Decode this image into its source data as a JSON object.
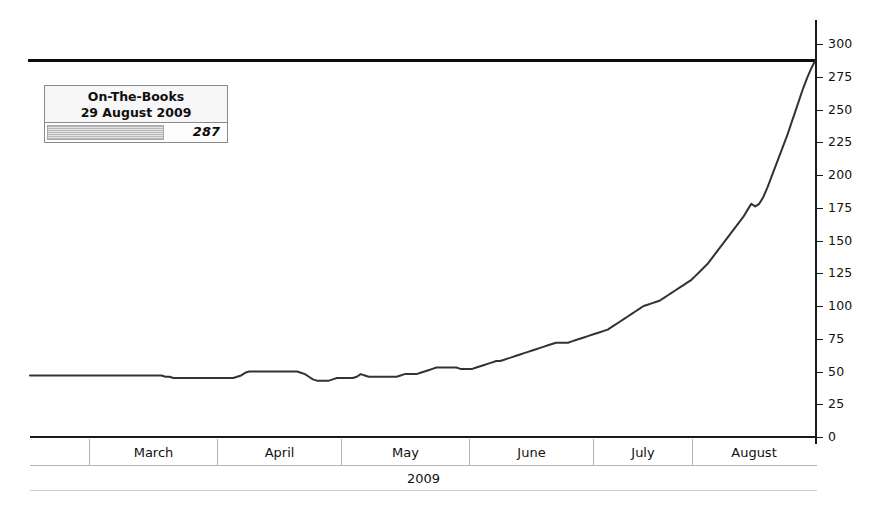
{
  "chart_data": {
    "type": "line",
    "title": "",
    "xlabel": "2009",
    "ylabel": "",
    "ylim": [
      0,
      300
    ],
    "ytick_step": 25,
    "yticks": [
      0,
      25,
      50,
      75,
      100,
      125,
      150,
      175,
      200,
      225,
      250,
      275,
      300
    ],
    "ytick_labels": [
      "0",
      "25",
      "50",
      "75",
      "100",
      "125",
      "150",
      "175",
      "200",
      "225",
      "250",
      "275",
      "300"
    ],
    "grid": false,
    "legend_position": "top-left",
    "categories": [
      "February",
      "March",
      "April",
      "May",
      "June",
      "July",
      "August"
    ],
    "series": [
      {
        "name": "On-The-Books",
        "color": "#333333",
        "x": [
          0,
          1,
          2,
          3,
          4,
          5,
          6,
          7,
          8,
          9,
          10,
          11,
          12,
          13,
          14,
          15,
          16,
          17,
          18,
          19,
          20,
          21,
          22,
          23,
          24,
          25,
          26,
          27,
          28,
          29,
          30,
          31,
          32,
          33,
          34,
          35,
          36,
          37,
          38,
          39,
          40,
          41,
          42,
          43,
          44,
          45,
          46,
          47,
          48,
          49,
          50,
          51,
          52,
          53,
          54,
          55,
          56,
          57,
          58,
          59,
          60,
          61,
          62,
          63,
          64,
          65,
          66,
          67,
          68,
          69,
          70,
          71,
          72,
          73,
          74,
          75,
          76,
          77,
          78,
          79,
          80,
          81,
          82,
          83,
          84,
          85,
          86,
          87,
          88,
          89,
          90,
          91,
          92,
          93,
          94,
          95,
          96,
          97,
          98,
          99,
          100,
          101,
          102,
          103,
          104,
          105,
          106,
          107,
          108,
          109,
          110,
          111,
          112,
          113,
          114,
          115,
          116,
          117,
          118,
          119,
          120,
          121,
          122,
          123,
          124,
          125,
          126,
          127,
          128,
          129,
          130,
          131,
          132,
          133,
          134,
          135,
          136,
          137,
          138,
          139,
          140,
          141,
          142,
          143,
          144,
          145,
          146,
          147,
          148,
          149,
          150,
          151,
          152,
          153,
          154,
          155,
          156,
          157,
          158,
          159,
          160,
          161,
          162,
          163,
          164,
          165,
          166,
          167,
          168,
          169,
          170,
          171,
          172,
          173,
          174,
          175,
          176,
          177,
          178,
          179,
          180,
          181,
          182,
          183,
          184,
          185,
          186,
          187,
          188,
          189,
          190,
          191,
          192,
          193,
          194,
          195,
          196,
          197
        ],
        "values": [
          47,
          47,
          47,
          47,
          47,
          47,
          47,
          47,
          47,
          47,
          47,
          47,
          47,
          47,
          47,
          47,
          47,
          47,
          47,
          47,
          47,
          47,
          47,
          47,
          47,
          47,
          47,
          47,
          47,
          47,
          47,
          47,
          47,
          47,
          46,
          46,
          45,
          45,
          45,
          45,
          45,
          45,
          45,
          45,
          45,
          45,
          45,
          45,
          45,
          45,
          45,
          45,
          46,
          47,
          49,
          50,
          50,
          50,
          50,
          50,
          50,
          50,
          50,
          50,
          50,
          50,
          50,
          50,
          49,
          48,
          46,
          44,
          43,
          43,
          43,
          43,
          44,
          45,
          45,
          45,
          45,
          45,
          46,
          48,
          47,
          46,
          46,
          46,
          46,
          46,
          46,
          46,
          46,
          47,
          48,
          48,
          48,
          48,
          49,
          50,
          51,
          52,
          53,
          53,
          53,
          53,
          53,
          53,
          52,
          52,
          52,
          52,
          53,
          54,
          55,
          56,
          57,
          58,
          58,
          59,
          60,
          61,
          62,
          63,
          64,
          65,
          66,
          67,
          68,
          69,
          70,
          71,
          72,
          72,
          72,
          72,
          73,
          74,
          75,
          76,
          77,
          78,
          79,
          80,
          81,
          82,
          84,
          86,
          88,
          90,
          92,
          94,
          96,
          98,
          100,
          101,
          102,
          103,
          104,
          106,
          108,
          110,
          112,
          114,
          116,
          118,
          120,
          123,
          126,
          129,
          132,
          136,
          140,
          144,
          148,
          152,
          156,
          160,
          164,
          168,
          173,
          178,
          176,
          178,
          183,
          190,
          198,
          206,
          214,
          222,
          230,
          239,
          248,
          257,
          266,
          274,
          281,
          287
        ]
      }
    ],
    "reference_line": {
      "name": "Capacity",
      "value": 287,
      "color": "#0d0d0d"
    },
    "annotations": []
  },
  "legend": {
    "title_line1": "On-The-Books",
    "title_line2": "29 August 2009",
    "value": "287"
  },
  "xaxis": {
    "months": [
      {
        "label": "",
        "width": 60
      },
      {
        "label": "March",
        "width": 128
      },
      {
        "label": "April",
        "width": 124
      },
      {
        "label": "May",
        "width": 128
      },
      {
        "label": "June",
        "width": 124
      },
      {
        "label": "July",
        "width": 99
      },
      {
        "label": "August",
        "width": 122
      }
    ],
    "year": "2009"
  }
}
